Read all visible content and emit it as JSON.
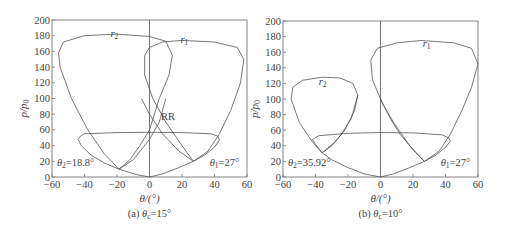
{
  "chart_data": [
    {
      "id": "a",
      "type": "line",
      "title": "",
      "caption": "(a) θc=15°",
      "caption_prefix": "(a) ",
      "caption_var": "θ",
      "caption_sub": "c",
      "caption_suffix": "=15°",
      "xlabel": "θ/(°)",
      "ylabel": "p/p0",
      "xlim": [
        -60,
        60
      ],
      "ylim": [
        0,
        200
      ],
      "xticks": [
        -60,
        -40,
        -20,
        0,
        20,
        40,
        60
      ],
      "yticks": [
        0,
        20,
        40,
        60,
        80,
        100,
        120,
        140,
        160,
        180,
        200
      ],
      "grid": false,
      "vertical_line_at": 0,
      "series": [
        {
          "name": "r2",
          "label": "r",
          "label_sub": "2",
          "label_pos": [
            -24,
            178
          ],
          "points": [
            [
              -18.8,
              10
            ],
            [
              -28,
              30
            ],
            [
              -38,
              60
            ],
            [
              -48,
              100
            ],
            [
              -55,
              140
            ],
            [
              -56,
              158
            ],
            [
              -53,
              172
            ],
            [
              -40,
              180
            ],
            [
              -20,
              182
            ],
            [
              0,
              179
            ],
            [
              10,
              173
            ],
            [
              14,
              155
            ],
            [
              12,
              130
            ],
            [
              6,
              100
            ],
            [
              0,
              60
            ],
            [
              -6,
              40
            ],
            [
              -12,
              22
            ],
            [
              -18.8,
              10
            ]
          ]
        },
        {
          "name": "r1",
          "label": "r",
          "label_sub": "1",
          "label_pos": [
            19,
            171
          ],
          "points": [
            [
              27,
              20
            ],
            [
              20,
              40
            ],
            [
              10,
              70
            ],
            [
              2,
              100
            ],
            [
              -3,
              130
            ],
            [
              -3,
              155
            ],
            [
              0,
              165
            ],
            [
              8,
              172
            ],
            [
              20,
              174
            ],
            [
              40,
              172
            ],
            [
              54,
              165
            ],
            [
              58,
              150
            ],
            [
              56,
              120
            ],
            [
              50,
              85
            ],
            [
              43,
              55
            ],
            [
              36,
              33
            ],
            [
              27,
              20
            ]
          ]
        },
        {
          "name": "dome",
          "label": "",
          "points": [
            [
              -40,
              55
            ],
            [
              -20,
              56.5
            ],
            [
              0,
              57
            ],
            [
              20,
              56.5
            ],
            [
              38,
              55
            ],
            [
              42,
              52
            ],
            [
              43,
              47
            ],
            [
              40,
              38
            ],
            [
              34,
              28
            ],
            [
              27,
              20
            ],
            [
              18,
              12
            ],
            [
              8,
              4
            ],
            [
              0,
              0
            ],
            [
              -8,
              3
            ],
            [
              -18.8,
              10
            ],
            [
              -28,
              18
            ],
            [
              -36,
              28
            ],
            [
              -42,
              40
            ],
            [
              -44,
              48
            ],
            [
              -42,
              53
            ],
            [
              -40,
              55
            ]
          ]
        },
        {
          "name": "cross-left",
          "label": "",
          "points": [
            [
              -18.8,
              10
            ],
            [
              -10,
              22
            ],
            [
              0,
              48
            ],
            [
              6,
              70
            ],
            [
              10,
              100
            ]
          ]
        },
        {
          "name": "cross-right",
          "label": "",
          "points": [
            [
              -5,
              100
            ],
            [
              0,
              80
            ],
            [
              8,
              55
            ],
            [
              18,
              33
            ],
            [
              27,
              20
            ]
          ]
        }
      ],
      "annotations": [
        {
          "text": "RR",
          "x": 7,
          "y": 72
        },
        {
          "text_var": "θ",
          "sub": "2",
          "value": "=18.8°",
          "x": -57,
          "y": 14
        },
        {
          "text_var": "θ",
          "sub": "1",
          "value": "=27°",
          "x": 37,
          "y": 14
        }
      ]
    },
    {
      "id": "b",
      "type": "line",
      "title": "",
      "caption": "(b) θc=10°",
      "caption_prefix": "(b) ",
      "caption_var": "θ",
      "caption_sub": "c",
      "caption_suffix": "=10°",
      "xlabel": "θ/(°)",
      "ylabel": "p/p0",
      "xlim": [
        -60,
        60
      ],
      "ylim": [
        0,
        200
      ],
      "xticks": [
        -60,
        -40,
        -20,
        0,
        20,
        40,
        60
      ],
      "yticks": [
        0,
        20,
        40,
        60,
        80,
        100,
        120,
        140,
        160,
        180,
        200
      ],
      "grid": false,
      "vertical_line_at": 0,
      "series": [
        {
          "name": "r2",
          "label": "r",
          "label_sub": "2",
          "label_pos": [
            -38,
            118
          ],
          "points": [
            [
              -35.92,
              31
            ],
            [
              -42,
              45
            ],
            [
              -50,
              70
            ],
            [
              -55,
              100
            ],
            [
              -54,
              115
            ],
            [
              -48,
              124
            ],
            [
              -36,
              128
            ],
            [
              -25,
              127
            ],
            [
              -17,
              120
            ],
            [
              -14,
              105
            ],
            [
              -16,
              85
            ],
            [
              -22,
              60
            ],
            [
              -28,
              45
            ],
            [
              -35.92,
              31
            ]
          ]
        },
        {
          "name": "r1",
          "label": "r",
          "label_sub": "1",
          "label_pos": [
            26,
            167
          ],
          "points": [
            [
              27,
              20
            ],
            [
              18,
              40
            ],
            [
              8,
              70
            ],
            [
              1,
              95
            ],
            [
              -5,
              125
            ],
            [
              -6,
              150
            ],
            [
              -2,
              165
            ],
            [
              10,
              172
            ],
            [
              25,
              175
            ],
            [
              45,
              172
            ],
            [
              56,
              165
            ],
            [
              60,
              145
            ],
            [
              56,
              115
            ],
            [
              50,
              85
            ],
            [
              43,
              55
            ],
            [
              36,
              33
            ],
            [
              27,
              20
            ]
          ]
        },
        {
          "name": "dome",
          "label": "",
          "points": [
            [
              -42,
              48
            ],
            [
              -38,
              53
            ],
            [
              -20,
              56
            ],
            [
              0,
              57
            ],
            [
              20,
              56.5
            ],
            [
              38,
              54
            ],
            [
              42,
              50
            ],
            [
              43,
              46
            ],
            [
              40,
              38
            ],
            [
              34,
              28
            ],
            [
              27,
              20
            ],
            [
              18,
              12
            ],
            [
              8,
              4
            ],
            [
              0,
              0
            ],
            [
              -10,
              4
            ],
            [
              -20,
              12
            ],
            [
              -30,
              22
            ],
            [
              -35.92,
              31
            ],
            [
              -40,
              42
            ],
            [
              -42,
              48
            ]
          ]
        },
        {
          "name": "cross-left",
          "label": "",
          "points": [
            [
              -35.92,
              31
            ],
            [
              -30,
              40
            ],
            [
              -24,
              55
            ],
            [
              -18,
              75
            ],
            [
              -14,
              105
            ]
          ]
        },
        {
          "name": "cross-right",
          "label": "",
          "points": [
            [
              0,
              100
            ],
            [
              6,
              75
            ],
            [
              12,
              55
            ],
            [
              20,
              35
            ],
            [
              27,
              20
            ]
          ]
        }
      ],
      "annotations": [
        {
          "text_var": "θ",
          "sub": "2",
          "value": "=35.92°",
          "x": -57,
          "y": 14
        },
        {
          "text_var": "θ",
          "sub": "1",
          "value": "=27°",
          "x": 37,
          "y": 14
        }
      ]
    }
  ],
  "layout": {
    "plots": [
      {
        "left": 52,
        "right": 247,
        "top": 20,
        "bottom": 177
      },
      {
        "left": 283,
        "right": 478,
        "top": 21,
        "bottom": 177
      }
    ]
  }
}
